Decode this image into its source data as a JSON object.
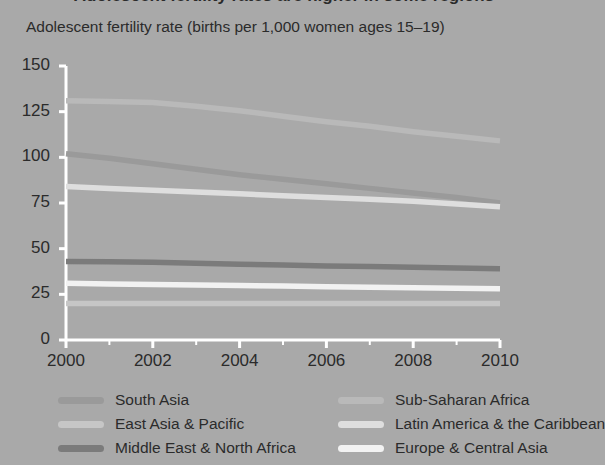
{
  "figure": {
    "clipped_title": "Adolescent fertility rates are higher in some regions",
    "axis_title": "Adolescent fertility rate (births per 1,000 women ages 15–19)",
    "background_color": "#a9a9a9",
    "axis_color": "#ffffff",
    "text_color": "#2b2b2b"
  },
  "chart_data": {
    "type": "line",
    "title": "Adolescent fertility rate (births per 1,000 women ages 15–19)",
    "xlabel": "",
    "ylabel": "Adolescent fertility rate (births per 1,000 women ages 15–19)",
    "xlim": [
      2000,
      2010
    ],
    "ylim": [
      0,
      150
    ],
    "xticks": [
      2000,
      2002,
      2004,
      2006,
      2008,
      2010
    ],
    "xtick_labels": [
      "2000",
      "2002",
      "2004",
      "2006",
      "2008",
      "2010"
    ],
    "yticks": [
      0,
      25,
      50,
      75,
      100,
      125,
      150
    ],
    "ytick_labels": [
      "0",
      "25",
      "50",
      "75",
      "100",
      "125",
      "150"
    ],
    "minor_xticks": [
      2001,
      2003,
      2005,
      2007,
      2009
    ],
    "grid": false,
    "legend_position": "bottom",
    "x": [
      2000,
      2001,
      2002,
      2003,
      2004,
      2005,
      2006,
      2007,
      2008,
      2009,
      2010
    ],
    "series": [
      {
        "name": "Sub-Saharan Africa",
        "color": "#b9b9b9",
        "values": [
          131,
          130.6,
          130,
          128,
          125.5,
          122.5,
          119.5,
          117,
          114,
          111.5,
          109
        ]
      },
      {
        "name": "South Asia",
        "color": "#9a9a9a",
        "values": [
          102,
          99.5,
          96.5,
          93.5,
          90.5,
          88,
          85.5,
          83,
          80.5,
          78,
          75
        ]
      },
      {
        "name": "Latin America & the Caribbean",
        "color": "#dedede",
        "values": [
          84,
          83,
          82,
          81,
          80,
          79,
          78,
          77,
          76,
          74.5,
          73
        ]
      },
      {
        "name": "Middle East & North Africa",
        "color": "#7b7b7b",
        "values": [
          43,
          42.8,
          42.5,
          42,
          41.5,
          41,
          40.5,
          40.2,
          39.8,
          39.4,
          39
        ]
      },
      {
        "name": "Europe & Central Asia",
        "color": "#f2f2f2",
        "values": [
          31,
          30.7,
          30.4,
          30.1,
          29.8,
          29.5,
          29.2,
          28.9,
          28.6,
          28.3,
          28
        ]
      },
      {
        "name": "East Asia & Pacific",
        "color": "#c6c6c6",
        "values": [
          20,
          20,
          20,
          20,
          20,
          20,
          20,
          20,
          20,
          20,
          20
        ]
      }
    ]
  },
  "legend": {
    "left_column": [
      {
        "label": "South Asia",
        "color": "#9a9a9a"
      },
      {
        "label": "East Asia & Pacific",
        "color": "#c6c6c6"
      },
      {
        "label": "Middle East & North Africa",
        "color": "#7b7b7b"
      }
    ],
    "right_column": [
      {
        "label": "Sub-Saharan Africa",
        "color": "#b9b9b9"
      },
      {
        "label": "Latin America & the Caribbean",
        "color": "#dedede"
      },
      {
        "label": "Europe & Central Asia",
        "color": "#f2f2f2"
      }
    ]
  }
}
